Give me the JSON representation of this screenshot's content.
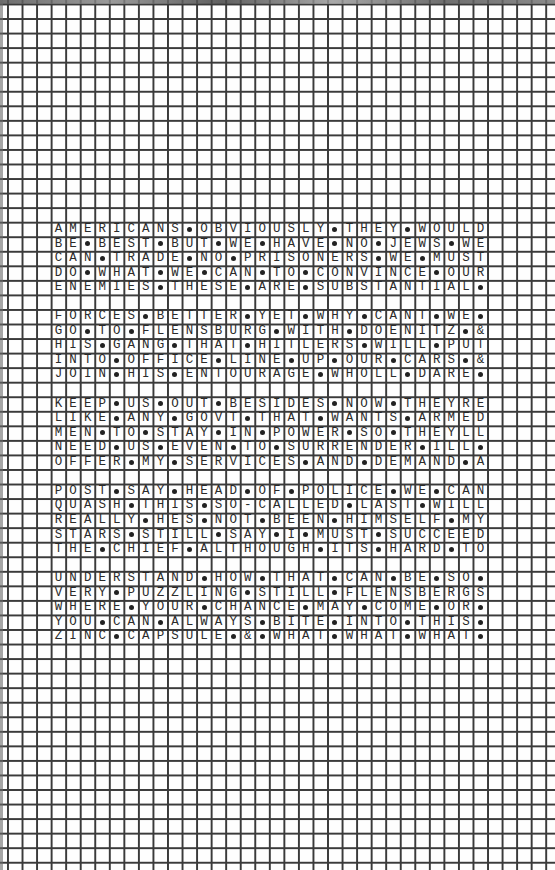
{
  "page": {
    "type": "graph-paper grid puzzle page",
    "grid_columns": 38,
    "grid_rows": 60,
    "text_start_column": 3,
    "text_start_row": 15,
    "separator_symbol": "•",
    "colors": {
      "grid_line": "#3a3a3a",
      "paper": "#fefefe",
      "text": "#2a2a2a"
    }
  },
  "blocks": [
    {
      "rows": [
        "AMERICANS•OBVIOUSLY•THEY•WOULD",
        "BE•BEST•BUT•WE•HAVE•NO•JEWS•WE",
        "CAN•TRADE•NO•PRISONERS•WE•MUST",
        "DO•WHAT•WE•CAN•TO•CONVINCE•OUR",
        "ENEMIES•THESE•ARE•SUBSTANTIAL•"
      ]
    },
    {
      "rows": [
        "FORCES•BETTER•YET•WHY•CANT•WE•",
        "GO•TO•FLENSBURG•WITH•DOENITZ•&",
        "HIS•GANG•THAT•HITLERS•WILL•PUT",
        "INTO•OFFICE•LINE•UP•OUR•CARS•&",
        "JOIN•HIS•ENTOURAGE•WHOLL•DARE•"
      ]
    },
    {
      "rows": [
        "KEEP•US•OUT•BESIDES•NOW•THEYRE",
        "LIKE•ANY•GOVT•THAT•WANTS•ARMED",
        "MEN•TO•STAY•IN•POWER•SO•THEYLL",
        "NEED•US•EVEN•TO•SURRENDER•ILL•",
        "OFFER•MY•SERVICES•AND•DEMAND•A"
      ]
    },
    {
      "rows": [
        "POST•SAY•HEAD•OF•POLICE•WE•CAN",
        "QUASH•THIS•SO-CALLED•LAST•WILL",
        "REALLY•HES•NOT•BEEN•HIMSELF•MY",
        "STARS•STILL•SAY•I•MUST•SUCCEED",
        "THE•CHIEF•ALTHOUGH•ITS•HARD•TO"
      ]
    },
    {
      "rows": [
        "UNDERSTAND•HOW•THAT•CAN•BE•SO•",
        "VERY•PUZZLING•STILL•FLENSBERGS",
        "WHERE•YOUR•CHANCE•MAY•COME•OR•",
        "YOU•CAN•ALWAYS•BITE•INTO•THIS•",
        "ZINC•CAPSULE•&•WHAT•WHAT•WHAT•"
      ]
    }
  ]
}
